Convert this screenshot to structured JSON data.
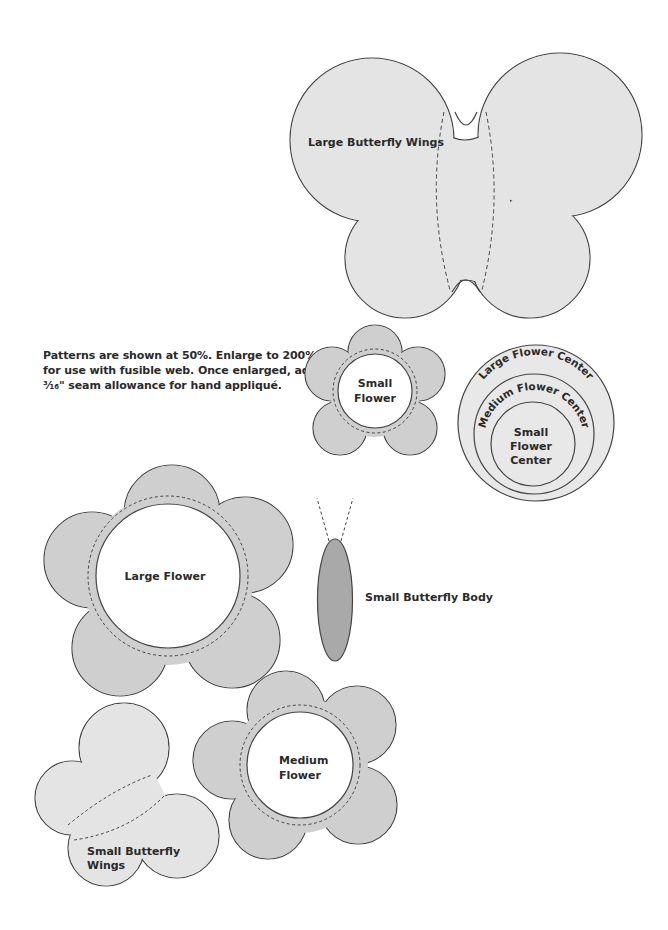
{
  "page": {
    "instructions": {
      "line1": "Patterns are shown at 50%. Enlarge to 200%",
      "line2": "for use with fusible web. Once enlarged, add",
      "line3": "³⁄₁₆\" seam allowance for hand appliqué."
    },
    "patterns": {
      "large_butterfly_wings": {
        "label": "Large Butterfly Wings"
      },
      "small_flower": {
        "label_line1": "Small",
        "label_line2": "Flower"
      },
      "flower_centers": {
        "large": "Large Flower Center",
        "medium": "Medium Flower Center",
        "small_line1": "Small",
        "small_line2": "Flower",
        "small_line3": "Center"
      },
      "large_flower": {
        "label": "Large Flower"
      },
      "small_butterfly_body": {
        "label": "Small Butterfly Body"
      },
      "medium_flower": {
        "label_line1": "Medium",
        "label_line2": "Flower"
      },
      "small_butterfly_wings": {
        "label_line1": "Small Butterfly",
        "label_line2": "Wings"
      }
    },
    "colors": {
      "wing_fill": "#e4e4e4",
      "flower_fill": "#cfcfcf",
      "center_fill": "#e8e8e8",
      "body_fill": "#a9a9a9",
      "outline": "#444444"
    }
  }
}
